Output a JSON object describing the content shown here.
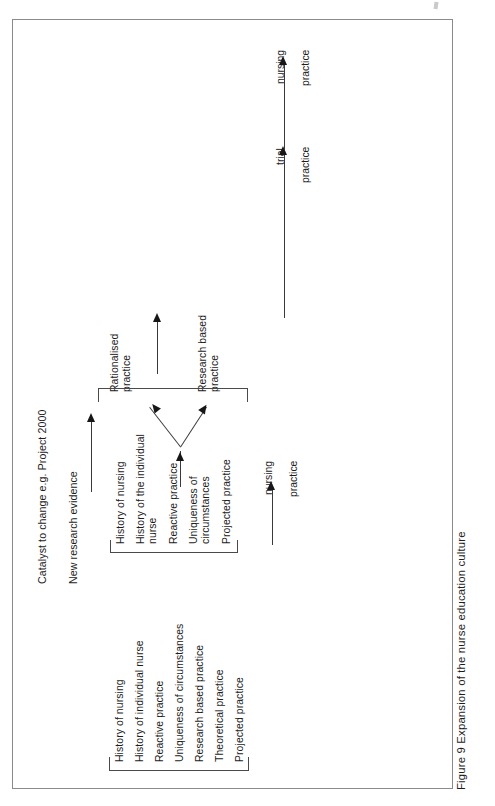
{
  "figure": {
    "caption": "Figure 9 Expansion of the nurse education culture",
    "frame_color": "#8a8a8a",
    "ink_color": "#1c1c1c"
  },
  "catalyst": {
    "heading": "Catalyst to change e.g. Project 2000",
    "driver_label": "New research evidence"
  },
  "timeline": {
    "stage1_top": "nursing",
    "stage1_bottom": "practice",
    "stage2_top": "trial",
    "stage2_bottom": "practice",
    "stage3_top": "nursing",
    "stage3_bottom": "practice"
  },
  "initial_culture": {
    "items": [
      "History of nursing",
      "History of individual nurse",
      "Reactive practice",
      "Uniqueness of circumstances",
      "Research based practice",
      "Theoretical practice",
      "Projected practice"
    ]
  },
  "expanded_culture": {
    "items": [
      "History of nursing",
      "History of the individual\nnurse",
      "Reactive practice",
      "Uniqueness of\ncircumstances",
      "Projected practice"
    ]
  },
  "outcomes": {
    "rationalised": "Rationalised\npractice",
    "research_based": "Research based\npractice"
  }
}
